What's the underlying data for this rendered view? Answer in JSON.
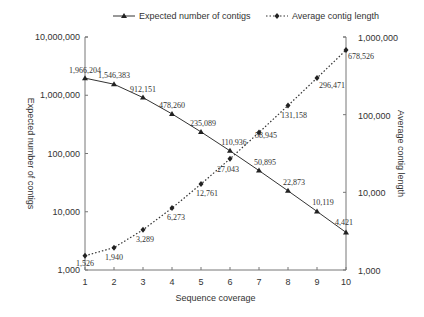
{
  "chart_data": {
    "type": "line",
    "title": "",
    "xlabel": "Sequence coverage",
    "ylabel": "Expected number of contigs",
    "y2label": "Average contig length",
    "x": [
      1,
      2,
      3,
      4,
      5,
      6,
      7,
      8,
      9,
      10
    ],
    "xlim": [
      1,
      10
    ],
    "ylim": [
      1000,
      10000000
    ],
    "y2lim": [
      1000,
      1000000
    ],
    "yscale": "log",
    "y2scale": "log",
    "grid": false,
    "legend_position": "top",
    "x_ticks": [
      "1",
      "2",
      "3",
      "4",
      "5",
      "6",
      "7",
      "8",
      "9",
      "10"
    ],
    "y_ticks": [
      "1,000",
      "10,000",
      "100,000",
      "1,000,000",
      "10,000,000"
    ],
    "y2_ticks": [
      "1,000",
      "10,000",
      "100,000",
      "1,000,000"
    ],
    "series": [
      {
        "name": "Expected number of contigs",
        "axis": "left",
        "style": "solid",
        "marker": "triangle",
        "values": [
          1966204,
          1546383,
          912151,
          478260,
          235089,
          110936,
          50895,
          22873,
          10119,
          4421
        ],
        "labels": [
          "1,966,204",
          "1,546,383",
          "912,151",
          "478,260",
          "235,089",
          "110,936",
          "50,895",
          "22,873",
          "10,119",
          "4,421"
        ]
      },
      {
        "name": "Average contig length",
        "axis": "right",
        "style": "dotted",
        "marker": "diamond",
        "values": [
          1526,
          1940,
          3289,
          6273,
          12761,
          27043,
          58945,
          131158,
          296471,
          678526
        ],
        "labels": [
          "1,526",
          "1,940",
          "3,289",
          "6,273",
          "12,761",
          "27,043",
          "58,945",
          "131,158",
          "296,471",
          "678,526"
        ]
      }
    ]
  }
}
